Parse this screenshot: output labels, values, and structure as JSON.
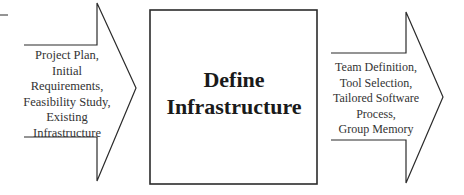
{
  "diagram": {
    "input": {
      "lines": [
        "Project Plan,",
        "Initial",
        "Requirements,",
        "Feasibility Study,",
        "Existing",
        "Infrastructure"
      ]
    },
    "process": {
      "lines": [
        "Define",
        "Infrastructure"
      ]
    },
    "output": {
      "lines": [
        "Team Definition,",
        "Tool Selection,",
        "Tailored Software",
        "Process,",
        "Group Memory"
      ]
    },
    "colors": {
      "stroke": "#2b2b2b",
      "text": "#333333",
      "background": "#ffffff"
    }
  }
}
